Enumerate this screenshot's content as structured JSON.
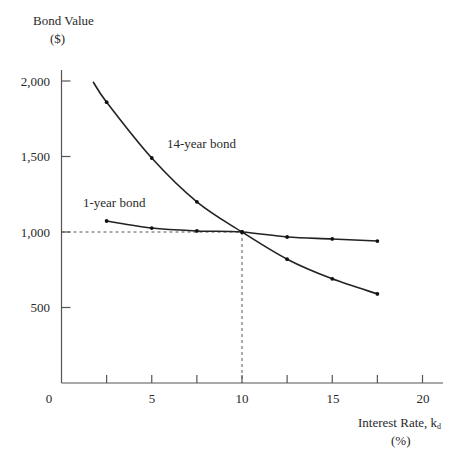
{
  "chart_data": {
    "type": "line",
    "title": "",
    "ylabel": "Bond Value",
    "ylabel_unit": "($)",
    "xlabel": "Interest Rate, k",
    "xlabel_subscript": "d",
    "xlabel_unit": "(%)",
    "xlim": [
      0,
      21
    ],
    "ylim": [
      0,
      2000
    ],
    "x_ticks": [
      0,
      2.5,
      5,
      7.5,
      10,
      12.5,
      15,
      17.5,
      20
    ],
    "x_tick_labels": [
      "0",
      "5",
      "10",
      "15",
      "20"
    ],
    "x_tick_label_values": [
      0,
      5,
      10,
      15,
      20
    ],
    "y_ticks": [
      500,
      1000,
      1500,
      2000
    ],
    "y_tick_labels": [
      "500",
      "1,000",
      "1,500",
      "2,000"
    ],
    "grid": false,
    "legend": "inline labels",
    "x": [
      2.5,
      5,
      7.5,
      10,
      12.5,
      15,
      17.5
    ],
    "series": [
      {
        "name": "14-year bond",
        "values": [
          1860,
          1490,
          1200,
          1000,
          820,
          690,
          590
        ],
        "curve_start": {
          "x": 1.75,
          "y": 1995
        }
      },
      {
        "name": "1-year bond",
        "values": [
          1073,
          1026,
          1007,
          1000,
          967,
          954,
          940
        ]
      }
    ],
    "annotations": [
      {
        "type": "dashed-reference",
        "x": 10,
        "y": 1000,
        "text": ""
      }
    ]
  },
  "labels": {
    "ylabel_line1": "Bond Value",
    "ylabel_line2": "($)",
    "xlabel_main": "Interest Rate, k",
    "xlabel_sub": "d",
    "xlabel_line2": "(%)",
    "series_14": "14-year bond",
    "series_1": "1-year bond",
    "y_2000": "2,000",
    "y_1500": "1,500",
    "y_1000": "1,000",
    "y_500": "500",
    "x_0": "0",
    "x_5": "5",
    "x_10": "10",
    "x_15": "15",
    "x_20": "20"
  }
}
